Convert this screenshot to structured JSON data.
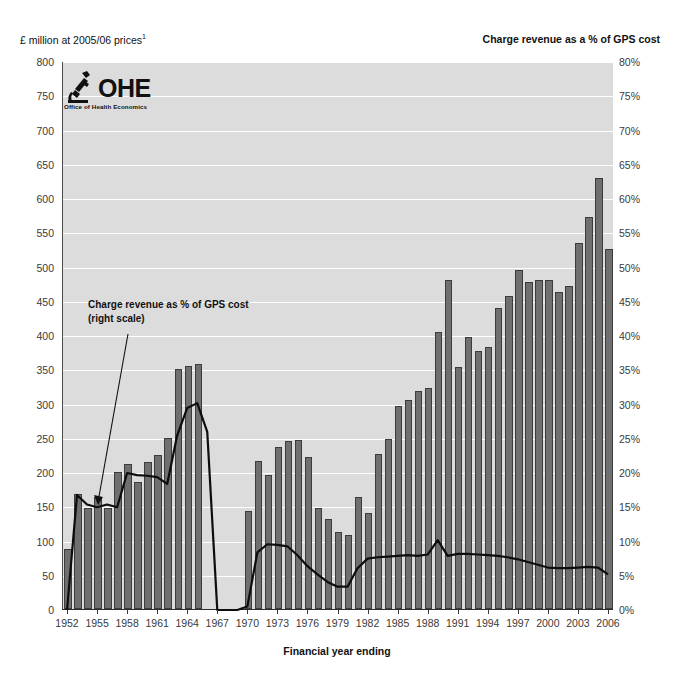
{
  "header": {
    "left_axis_title": "£ million at 2005/06 prices",
    "left_axis_title_superscript": "1",
    "right_axis_title": "Charge revenue as a % of GPS cost"
  },
  "logo": {
    "name": "OHE",
    "subtitle": "Office of Health Economics",
    "icon": "ohe-microscope-icon"
  },
  "annotation": {
    "line1": "Charge revenue as % of GPS cost",
    "line2": "(right scale)",
    "arrow": "arrow-pointing-down-left-icon"
  },
  "axes": {
    "xlabel": "Financial year ending",
    "y_left_ticks": [
      "0",
      "50",
      "100",
      "150",
      "200",
      "250",
      "300",
      "350",
      "400",
      "450",
      "500",
      "550",
      "600",
      "650",
      "700",
      "750",
      "800"
    ],
    "y_right_ticks": [
      "0%",
      "5%",
      "10%",
      "15%",
      "20%",
      "25%",
      "30%",
      "35%",
      "40%",
      "45%",
      "50%",
      "55%",
      "60%",
      "65%",
      "70%",
      "75%",
      "80%"
    ],
    "x_tick_labels": [
      "1952",
      "1955",
      "1958",
      "1961",
      "1964",
      "1967",
      "1970",
      "1973",
      "1976",
      "1979",
      "1982",
      "1985",
      "1988",
      "1991",
      "1994",
      "1997",
      "2000",
      "2003",
      "2006"
    ]
  },
  "colors": {
    "bar_fill": "#6f6f6f",
    "bar_stroke": "#3c3c3c",
    "line": "#0d0d0d",
    "plot_background": "#dcdcdc",
    "gridline": "#ffffff"
  },
  "chart_data": {
    "type": "bar",
    "title": "",
    "subtitle": "",
    "xlabel": "Financial year ending",
    "ylabel": "£ million at 2005/06 prices",
    "ylabel_secondary": "Charge revenue as a % of GPS cost",
    "ylim": [
      0,
      800
    ],
    "ylim_secondary": [
      0,
      80
    ],
    "grid": true,
    "legend_position": "none",
    "annotations": [
      {
        "text": "Charge revenue as % of GPS cost (right scale)",
        "points_to_year": 1956,
        "series": "Charge revenue as % of GPS cost"
      }
    ],
    "categories": [
      1952,
      1953,
      1954,
      1955,
      1956,
      1957,
      1958,
      1959,
      1960,
      1961,
      1962,
      1963,
      1964,
      1965,
      1966,
      1967,
      1968,
      1969,
      1970,
      1971,
      1972,
      1973,
      1974,
      1975,
      1976,
      1977,
      1978,
      1979,
      1980,
      1981,
      1982,
      1983,
      1984,
      1985,
      1986,
      1987,
      1988,
      1989,
      1990,
      1991,
      1992,
      1993,
      1994,
      1995,
      1996,
      1997,
      1998,
      1999,
      2000,
      2001,
      2002,
      2003,
      2004,
      2005,
      2006
    ],
    "series": [
      {
        "name": "Charge revenue (£ million at 2005/06 prices)",
        "axis": "left",
        "type": "bar",
        "values": [
          88,
          168,
          148,
          163,
          148,
          200,
          212,
          186,
          214,
          225,
          250,
          350,
          355,
          357,
          0,
          0,
          0,
          0,
          143,
          216,
          196,
          237,
          245,
          247,
          222,
          148,
          132,
          113,
          108,
          163,
          140,
          227,
          248,
          297,
          305,
          319,
          322,
          405,
          481,
          353,
          397,
          376,
          383,
          440,
          457,
          495,
          478,
          481,
          480,
          463,
          472,
          535,
          572,
          629,
          525
        ]
      },
      {
        "name": "Charge revenue as % of GPS cost",
        "axis": "right",
        "type": "line",
        "values": [
          0.0,
          16.8,
          15.4,
          15.0,
          15.4,
          15.0,
          20.0,
          19.7,
          19.6,
          19.4,
          18.4,
          25.5,
          29.5,
          30.2,
          26.0,
          0.0,
          0.0,
          0.0,
          0.5,
          8.4,
          9.6,
          9.5,
          9.3,
          8.0,
          6.4,
          5.2,
          4.1,
          3.4,
          3.4,
          6.1,
          7.5,
          7.7,
          7.8,
          7.9,
          8.0,
          7.9,
          8.1,
          10.2,
          7.9,
          8.2,
          8.2,
          8.1,
          8.0,
          7.9,
          7.7,
          7.4,
          7.0,
          6.6,
          6.2,
          6.1,
          6.1,
          6.2,
          6.3,
          6.2,
          5.2
        ]
      }
    ]
  }
}
